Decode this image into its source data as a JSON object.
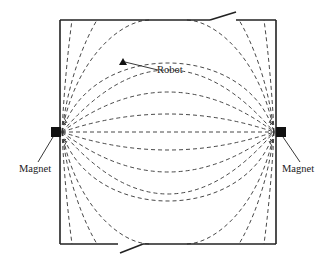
{
  "diagram": {
    "labels": {
      "robot": "Robot",
      "magnet_left": "Magnet",
      "magnet_right": "Magnet"
    },
    "colors": {
      "wall": "#222222",
      "field_line": "#333333",
      "magnet": "#111111",
      "robot": "#111111"
    },
    "room": {
      "x1": 60,
      "y1": 20,
      "x2": 276,
      "y2": 244
    },
    "top_door": {
      "gap_from": 210,
      "gap_to": 236,
      "leaf_end": [
        236,
        12
      ]
    },
    "bottom_door": {
      "gap_from": 118,
      "gap_to": 143,
      "leaf_end": [
        120,
        253
      ]
    },
    "magnets": [
      {
        "id": "left",
        "x": 56,
        "y": 132
      },
      {
        "id": "right",
        "x": 281,
        "y": 132
      }
    ],
    "robot": {
      "x": 123,
      "y": 62
    },
    "field_lines_count": 15
  }
}
